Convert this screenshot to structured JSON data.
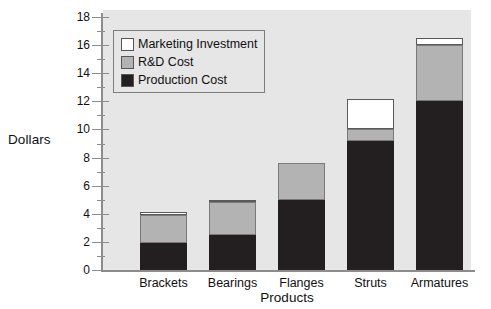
{
  "chart_data": {
    "type": "bar",
    "subtype": "stacked-bar",
    "title": "",
    "xlabel": "Products",
    "ylabel": "Dollars",
    "categories": [
      "Brackets",
      "Bearings",
      "Flanges",
      "Struts",
      "Armatures"
    ],
    "series": [
      {
        "name": "Production Cost",
        "color": "#231f20",
        "values": [
          1.9,
          2.5,
          5.0,
          9.2,
          12.0
        ]
      },
      {
        "name": "R&D Cost",
        "color": "#b3b3b3",
        "values": [
          2.0,
          2.35,
          2.6,
          0.8,
          4.0
        ]
      },
      {
        "name": "Marketing Investment",
        "color": "#ffffff",
        "values": [
          0.2,
          0.15,
          0.0,
          2.2,
          0.5
        ]
      }
    ],
    "cumulative_tops": {
      "Brackets": {
        "production": 1.9,
        "rd": 3.9,
        "marketing": 4.1
      },
      "Bearings": {
        "production": 2.5,
        "rd": 4.85,
        "marketing": 5.0
      },
      "Flanges": {
        "production": 5.0,
        "rd": 7.6,
        "marketing": 7.6
      },
      "Struts": {
        "production": 9.2,
        "rd": 10.0,
        "marketing": 12.2
      },
      "Armatures": {
        "production": 12.0,
        "rd": 16.0,
        "marketing": 16.5
      }
    },
    "ylim": [
      0,
      18
    ],
    "ytick_major": [
      0,
      2,
      4,
      6,
      8,
      10,
      12,
      14,
      16,
      18
    ],
    "ytick_minor": [
      1,
      3,
      5,
      7,
      9,
      11,
      13,
      15,
      17
    ],
    "ytick_labels": [
      "0",
      "2",
      "4",
      "6",
      "8",
      "10",
      "12",
      "14",
      "16",
      "18"
    ],
    "grid": false,
    "legend_position": "upper-left-inside",
    "legend_entries": [
      "Marketing Investment",
      "R&D Cost",
      "Production Cost"
    ],
    "plot_background_color": "#e6e6e6",
    "axis_color": "#8c8c8c",
    "text_color": "#101010"
  }
}
